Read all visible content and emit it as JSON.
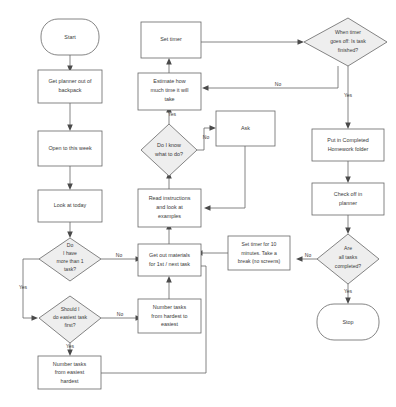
{
  "diagram": {
    "type": "flowchart",
    "background_color": "#ffffff",
    "stroke_color": "#666666",
    "decision_fill": "#eeeeee",
    "process_fill": "#ffffff",
    "text_color": "#3a3a3a"
  },
  "nodes": {
    "start": {
      "label": "Start",
      "shape": "terminator"
    },
    "get_planner": {
      "line1": "Get planner out of",
      "line2": "backpack",
      "shape": "process"
    },
    "open_week": {
      "line1": "Open to this week",
      "shape": "process"
    },
    "look_today": {
      "line1": "Look at today",
      "shape": "process"
    },
    "more_than_one": {
      "line1": "Do",
      "line2": "I have",
      "line3": "more than 1",
      "line4": "task?",
      "shape": "decision"
    },
    "easiest_first": {
      "line1": "Should I",
      "line2": "do easiest task",
      "line3": "first?",
      "shape": "decision"
    },
    "number_easiest": {
      "line1": "Number tasks",
      "line2": "from easiest",
      "line3": "hardest",
      "shape": "process"
    },
    "number_hardest": {
      "line1": "Number tasks",
      "line2": "from hardest to",
      "line3": "easiest",
      "shape": "process"
    },
    "get_materials": {
      "line1": "Get out materials",
      "line2": "for 1st / next task",
      "shape": "process"
    },
    "read_instructions": {
      "line1": "Read instructions",
      "line2": "and look at",
      "line3": "examples",
      "shape": "process"
    },
    "know_what_to_do": {
      "line1": "Do I know",
      "line2": "what to do?",
      "shape": "decision"
    },
    "ask": {
      "line1": "Ask",
      "shape": "process"
    },
    "estimate_time": {
      "line1": "Estimate how",
      "line2": "much time it will",
      "line3": "take",
      "shape": "process"
    },
    "set_timer": {
      "line1": "Set timer",
      "shape": "process"
    },
    "timer_goes_off": {
      "line1": "When timer",
      "line2": "goes off:  Is task",
      "line3": "finished?",
      "shape": "decision"
    },
    "put_completed": {
      "line1": "Put in Completed",
      "line2": "Homework folder",
      "shape": "process"
    },
    "check_off": {
      "line1": "Check off in",
      "line2": "planner",
      "shape": "process"
    },
    "all_completed": {
      "line1": "Are",
      "line2": "all tasks",
      "line3": "completed?",
      "shape": "decision"
    },
    "break_timer": {
      "line1": "Set timer for 10",
      "line2": "minutes.  Take a",
      "line3": "break (no screens)",
      "shape": "process"
    },
    "stop": {
      "label": "Stop",
      "shape": "terminator"
    }
  },
  "edge_labels": {
    "more_than_one_no": "No",
    "more_than_one_yes": "Yes",
    "easiest_first_no": "No",
    "easiest_first_yes": "Yes",
    "know_what_to_do_no": "No",
    "know_what_to_do_yes": "Yes",
    "timer_goes_off_no": "No",
    "timer_goes_off_yes": "Yes",
    "all_completed_no": "No",
    "all_completed_yes": "Yes"
  }
}
